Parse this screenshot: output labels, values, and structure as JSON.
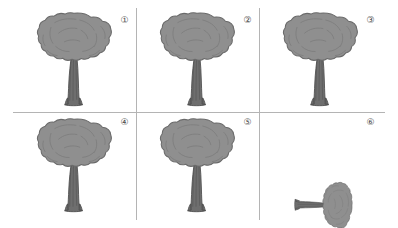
{
  "canvas": {
    "width": 398,
    "height": 228,
    "background_color": "#ffffff",
    "rule_color": "#b4b4b4"
  },
  "figure": {
    "kind": "mental-rotation-tree-grid",
    "rows": 2,
    "columns": 3,
    "canopy_fill": "#8f8f8f",
    "canopy_outline": "#6a6a6a",
    "canopy_shade": "#7d7d7d",
    "trunk_fill": "#6e6e6e",
    "trunk_outline": "#4f4f4f",
    "branch_color": "#4a4a4a"
  },
  "rules": {
    "vertical": [
      {
        "name": "vertical-rule-left",
        "x": 136,
        "y": 8,
        "height": 212
      },
      {
        "name": "vertical-rule-right",
        "x": 259,
        "y": 8,
        "height": 212
      }
    ],
    "horizontal": [
      {
        "name": "horizontal-rule-mid",
        "x": 13,
        "y": 112,
        "width": 372
      }
    ]
  },
  "panels": [
    {
      "id": "panel-1",
      "index_label": "①",
      "index_number": "1",
      "orientation_degrees": 0,
      "scale": 1.0,
      "tree_visible": true,
      "cell": {
        "x": 0,
        "y": 0,
        "width": 136,
        "height": 112
      },
      "index_pos": {
        "x": 118,
        "y": 14
      },
      "tree_pos": {
        "x": 34,
        "y": 12,
        "width": 80,
        "height": 96
      }
    },
    {
      "id": "panel-2",
      "index_label": "②",
      "index_number": "2",
      "orientation_degrees": 0,
      "scale": 1.0,
      "tree_visible": true,
      "cell": {
        "x": 136,
        "y": 0,
        "width": 123,
        "height": 112
      },
      "index_pos": {
        "x": 241,
        "y": 14
      },
      "tree_pos": {
        "x": 157,
        "y": 12,
        "width": 80,
        "height": 96
      }
    },
    {
      "id": "panel-3",
      "index_label": "③",
      "index_number": "3",
      "orientation_degrees": 0,
      "scale": 1.0,
      "tree_visible": true,
      "cell": {
        "x": 259,
        "y": 0,
        "width": 139,
        "height": 112
      },
      "index_pos": {
        "x": 364,
        "y": 14
      },
      "tree_pos": {
        "x": 280,
        "y": 12,
        "width": 80,
        "height": 96
      }
    },
    {
      "id": "panel-4",
      "index_label": "④",
      "index_number": "4",
      "orientation_degrees": 0,
      "scale": 1.0,
      "tree_visible": true,
      "cell": {
        "x": 0,
        "y": 112,
        "width": 136,
        "height": 116
      },
      "index_pos": {
        "x": 118,
        "y": 116
      },
      "tree_pos": {
        "x": 34,
        "y": 118,
        "width": 80,
        "height": 96
      }
    },
    {
      "id": "panel-5",
      "index_label": "⑤",
      "index_number": "5",
      "orientation_degrees": 0,
      "scale": 1.0,
      "tree_visible": true,
      "cell": {
        "x": 136,
        "y": 112,
        "width": 123,
        "height": 116
      },
      "index_pos": {
        "x": 241,
        "y": 116
      },
      "tree_pos": {
        "x": 157,
        "y": 118,
        "width": 80,
        "height": 96
      }
    },
    {
      "id": "panel-6",
      "index_label": "⑥",
      "index_number": "6",
      "orientation_degrees": 90,
      "scale": 0.62,
      "tree_visible": true,
      "cell": {
        "x": 259,
        "y": 112,
        "width": 139,
        "height": 116
      },
      "index_pos": {
        "x": 364,
        "y": 116
      },
      "tree_pos": {
        "x": 283,
        "y": 157,
        "width": 80,
        "height": 96
      }
    }
  ]
}
